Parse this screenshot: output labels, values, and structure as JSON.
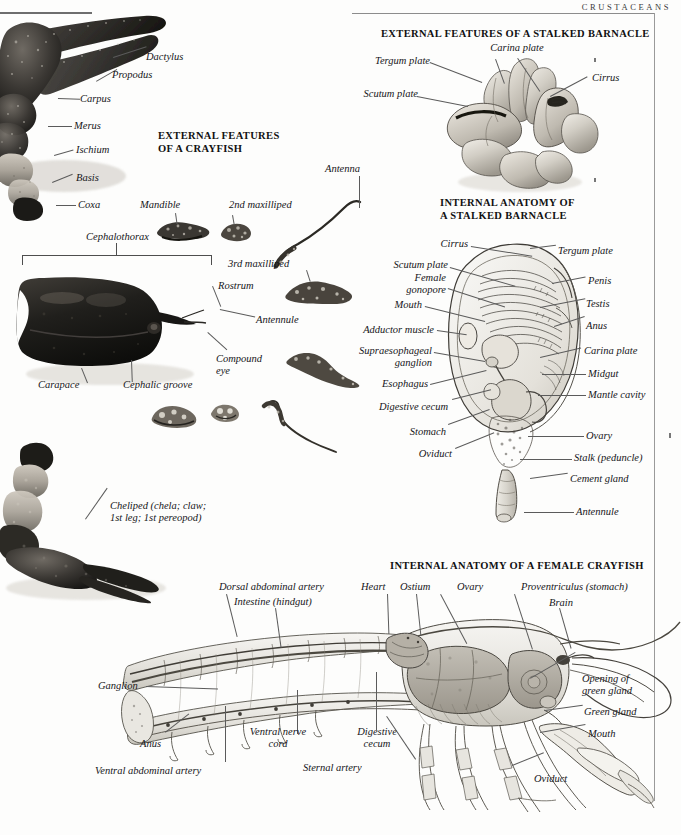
{
  "page": {
    "running_head": "CRUSTACEANS"
  },
  "sections": [
    {
      "id": "crayfish-external",
      "title_lines": [
        "EXTERNAL FEATURES",
        "OF A CRAYFISH"
      ]
    },
    {
      "id": "barnacle-external",
      "title_lines": [
        "EXTERNAL FEATURES OF A STALKED BARNACLE"
      ]
    },
    {
      "id": "barnacle-internal",
      "title_lines": [
        "INTERNAL ANATOMY OF",
        "A STALKED BARNACLE"
      ]
    },
    {
      "id": "crayfish-internal",
      "title_lines": [
        "INTERNAL ANATOMY OF A FEMALE CRAYFISH"
      ]
    }
  ],
  "labels": {
    "crayfish_external": [
      "Dactylus",
      "Propodus",
      "Carpus",
      "Merus",
      "Ischium",
      "Basis",
      "Coxa",
      "Cephalothorax",
      "Mandible",
      "2nd maxilliped",
      "3rd maxilliped",
      "Antenna",
      "Rostrum",
      "Antennule",
      "Compound\neye",
      "Carapace",
      "Cephalic groove",
      "Cheliped (chela; claw;\n1st leg; 1st pereopod)"
    ],
    "barnacle_external": [
      "Tergum plate",
      "Carina plate",
      "Cirrus",
      "Scutum plate"
    ],
    "barnacle_internal": [
      "Cirrus",
      "Scutum plate",
      "Female\ngonopore",
      "Mouth",
      "Adductor muscle",
      "Supraesophageal\nganglion",
      "Esophagus",
      "Digestive cecum",
      "Stomach",
      "Oviduct",
      "Tergum plate",
      "Penis",
      "Testis",
      "Anus",
      "Carina plate",
      "Midgut",
      "Mantle cavity",
      "Ovary",
      "Stalk (peduncle)",
      "Cement gland",
      "Antennule"
    ],
    "crayfish_internal": [
      "Dorsal abdominal artery",
      "Intestine (hindgut)",
      "Heart",
      "Ostium",
      "Ovary",
      "Proventriculus (stomach)",
      "Brain",
      "Opening of\ngreen gland",
      "Green gland",
      "Mouth",
      "Oviduct",
      "Ganglion",
      "Anus",
      "Ventral abdominal artery",
      "Ventral nerve\ncord",
      "Digestive\ncecum",
      "Sternal artery"
    ]
  }
}
